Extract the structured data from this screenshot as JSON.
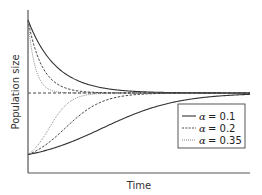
{
  "chart_data": {
    "type": "line",
    "title": "",
    "xlabel": "Time",
    "ylabel": "Population size",
    "grid": false,
    "legend_position": "lower right",
    "equilibrium_line": {
      "style": "dashed",
      "y": 0.5
    },
    "series": [
      {
        "name": "α = 0.1",
        "label_symbol": "α",
        "label_value": "= 0.1",
        "line_style": "solid",
        "rate": 0.1,
        "start_high": 0.95,
        "start_low": 0.05
      },
      {
        "name": "α = 0.2",
        "label_symbol": "α",
        "label_value": "= 0.2",
        "line_style": "dashed",
        "rate": 0.2,
        "start_high": 0.95,
        "start_low": 0.05
      },
      {
        "name": "α = 0.35",
        "label_symbol": "α",
        "label_value": "= 0.35",
        "line_style": "dotted",
        "rate": 0.35,
        "start_high": 0.95,
        "start_low": 0.05
      }
    ],
    "xlim": [
      0,
      1
    ],
    "ylim": [
      0,
      1
    ]
  },
  "colors": {
    "line": "#333333",
    "axis": "#555555",
    "text": "#333333"
  }
}
